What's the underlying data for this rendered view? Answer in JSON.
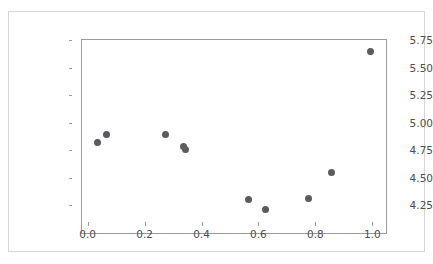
{
  "top_clipped_text": "···  ······ · ·····  ··· ··· ······",
  "figure": {
    "background_color": "#ffffff",
    "border_color": "#d6d6da",
    "axes_border_color": "#9a9aa0"
  },
  "chart_data": {
    "type": "scatter",
    "title": "",
    "xlabel": "",
    "ylabel": "",
    "xlim": [
      -0.055,
      1.02
    ],
    "ylim": [
      4.1,
      5.87
    ],
    "grid": false,
    "legend": null,
    "marker_color": "#5a5a5f",
    "marker_size": 7,
    "xticks": [
      0.0,
      0.2,
      0.4,
      0.6,
      0.8,
      1.0
    ],
    "xtick_labels": [
      "0.0",
      "0.2",
      "0.4",
      "0.6",
      "0.8",
      "1.0"
    ],
    "yticks": [
      4.25,
      4.5,
      4.75,
      5.0,
      5.25,
      5.5,
      5.75
    ],
    "ytick_labels": [
      "4.25",
      "4.50",
      "4.75",
      "5.00",
      "5.25",
      "5.50",
      "5.75"
    ],
    "points": [
      {
        "x": 0.0,
        "y": 4.94
      },
      {
        "x": 0.03,
        "y": 5.01
      },
      {
        "x": 0.24,
        "y": 5.01
      },
      {
        "x": 0.3,
        "y": 4.9
      },
      {
        "x": 0.31,
        "y": 4.88
      },
      {
        "x": 0.53,
        "y": 4.42
      },
      {
        "x": 0.59,
        "y": 4.33
      },
      {
        "x": 0.74,
        "y": 4.43
      },
      {
        "x": 0.82,
        "y": 4.67
      },
      {
        "x": 0.96,
        "y": 5.77
      }
    ]
  }
}
